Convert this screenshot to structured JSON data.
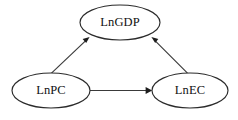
{
  "diagram": {
    "type": "directed-graph",
    "background_color": "#ffffff",
    "stroke_color": "#2b2b2b",
    "text_color": "#111111",
    "nodes": [
      {
        "id": "lngdp",
        "label": "LnGDP",
        "shape": "ellipse",
        "cx": 120,
        "cy": 22.5,
        "rx": 40,
        "ry": 17.5
      },
      {
        "id": "lnpc",
        "label": "LnPC",
        "shape": "ellipse",
        "cx": 51,
        "cy": 90.5,
        "rx": 39,
        "ry": 17.5
      },
      {
        "id": "lnec",
        "label": "LnEC",
        "shape": "ellipse",
        "cx": 190,
        "cy": 90.5,
        "rx": 38,
        "ry": 17.5
      }
    ],
    "edges": [
      {
        "id": "edge-lnpc-lngdp",
        "from": "LnPC",
        "to": "LnGDP",
        "arrow": "single",
        "direction": "up-right"
      },
      {
        "id": "edge-lnec-lngdp",
        "from": "LnEC",
        "to": "LnGDP",
        "arrow": "single",
        "direction": "up-left"
      },
      {
        "id": "edge-lnpc-lnec",
        "from": "LnPC",
        "to": "LnEC",
        "arrow": "single",
        "direction": "right"
      }
    ]
  }
}
